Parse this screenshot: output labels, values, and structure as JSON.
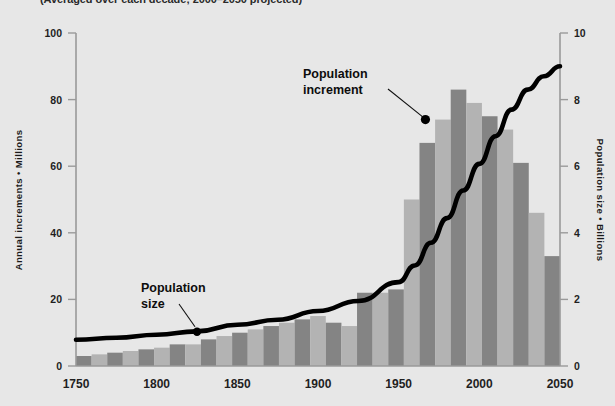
{
  "subtitle": "(Averaged over each decade; 2000–2050 projected)",
  "axes": {
    "left": {
      "title": "Annual increments • Millions",
      "ticks": [
        0,
        20,
        40,
        60,
        80,
        100
      ],
      "min": 0,
      "max": 100
    },
    "right": {
      "title": "Population size • Billions",
      "ticks": [
        0,
        2,
        4,
        6,
        8,
        10
      ],
      "min": 0,
      "max": 10
    },
    "x": {
      "ticks": [
        "1750",
        "1800",
        "1850",
        "1900",
        "1950",
        "2000",
        "2050"
      ],
      "min": 1750,
      "max": 2050
    }
  },
  "annotations": [
    {
      "label_line1": "Population",
      "label_line2": "increment",
      "target_decade": 1970,
      "target_value": 74
    },
    {
      "label_line1": "Population",
      "label_line2": "size",
      "target_year": 1825,
      "target_value": 1.0
    }
  ],
  "colors": {
    "background": "#e7e7e7",
    "bar_dark": "#848484",
    "bar_light": "#b3b3b3",
    "curve": "#000000",
    "axis": "#9a9a9a",
    "text": "#1b1b1b"
  },
  "chart_data": {
    "type": "bar",
    "xlabel": "",
    "ylabel": "Annual increments • Millions",
    "y2label": "Population size • Billions",
    "xlim": [
      1750,
      2050
    ],
    "ylim": [
      0,
      100
    ],
    "y2lim": [
      0,
      10
    ],
    "grid": false,
    "legend": "annotated-labels",
    "categories": [
      1750,
      1760,
      1770,
      1780,
      1790,
      1800,
      1810,
      1820,
      1830,
      1840,
      1850,
      1860,
      1870,
      1880,
      1890,
      1900,
      1910,
      1920,
      1930,
      1940,
      1950,
      1960,
      1970,
      1980,
      1990,
      2000,
      2010,
      2020,
      2030,
      2040
    ],
    "series": [
      {
        "name": "Population increment",
        "unit": "millions per year",
        "axis": "left",
        "values": [
          3,
          3.5,
          4,
          4.5,
          5,
          5.5,
          6.5,
          6.5,
          8,
          9,
          10,
          11,
          12,
          13,
          14,
          15,
          13,
          12,
          22,
          22,
          23,
          50,
          67,
          74,
          83,
          79,
          75,
          71,
          61,
          46
        ]
      },
      {
        "name": "Population size",
        "unit": "billions",
        "axis": "right",
        "x": [
          1750,
          1775,
          1800,
          1825,
          1850,
          1875,
          1900,
          1925,
          1950,
          1960,
          1970,
          1980,
          1990,
          2000,
          2010,
          2020,
          2030,
          2040,
          2050
        ],
        "values": [
          0.79,
          0.85,
          0.94,
          1.04,
          1.24,
          1.39,
          1.65,
          1.95,
          2.52,
          3.02,
          3.7,
          4.44,
          5.27,
          6.07,
          6.9,
          7.7,
          8.3,
          8.7,
          9.0
        ]
      }
    ],
    "last_bar_value": 33
  }
}
